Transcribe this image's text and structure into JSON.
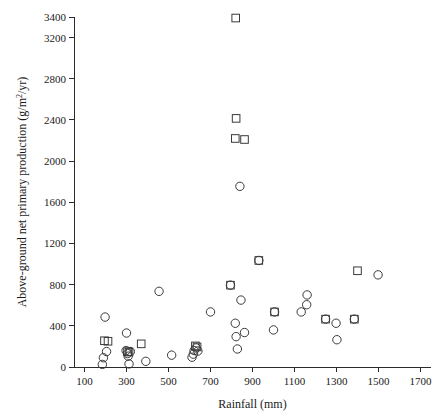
{
  "chart_data": {
    "type": "scatter",
    "title": "",
    "xlabel": "Rainfall (mm)",
    "ylabel": "Above-ground net primary production (g/m²/yr)",
    "ylabel_parts": {
      "before": "Above-ground net primary production (g/m",
      "sup": "2",
      "after": "/yr)"
    },
    "xlim": [
      50,
      1750
    ],
    "ylim": [
      0,
      3400
    ],
    "xticks": [
      100,
      300,
      500,
      700,
      900,
      1100,
      1300,
      1500,
      1700
    ],
    "xticklabels": [
      "100",
      "300",
      "500",
      "700",
      "900",
      "1100",
      "1300",
      "1500",
      "1700"
    ],
    "yticks": [
      0,
      400,
      800,
      1200,
      1600,
      2000,
      2400,
      2800,
      3200,
      3400
    ],
    "yticklabels": [
      "0",
      "400",
      "800",
      "1200",
      "1600",
      "2000",
      "2400",
      "2800",
      "3200",
      "3400"
    ],
    "grid": false,
    "legend": "none",
    "marker_color": "#3a3a3a",
    "series": [
      {
        "name": "circle-series",
        "marker": "circle",
        "points": [
          [
            185,
            25
          ],
          [
            190,
            90
          ],
          [
            198,
            485
          ],
          [
            205,
            150
          ],
          [
            300,
            330
          ],
          [
            298,
            160
          ],
          [
            305,
            130
          ],
          [
            308,
            105
          ],
          [
            312,
            30
          ],
          [
            318,
            150
          ],
          [
            392,
            55
          ],
          [
            455,
            735
          ],
          [
            515,
            115
          ],
          [
            612,
            95
          ],
          [
            618,
            125
          ],
          [
            622,
            160
          ],
          [
            632,
            185
          ],
          [
            640,
            155
          ],
          [
            700,
            535
          ],
          [
            818,
            425
          ],
          [
            822,
            295
          ],
          [
            828,
            175
          ],
          [
            840,
            1755
          ],
          [
            845,
            650
          ],
          [
            862,
            335
          ],
          [
            930,
            1035
          ],
          [
            795,
            795
          ],
          [
            1005,
            535
          ],
          [
            1000,
            360
          ],
          [
            1160,
            700
          ],
          [
            1158,
            605
          ],
          [
            1132,
            535
          ],
          [
            1298,
            425
          ],
          [
            1302,
            265
          ],
          [
            1248,
            465
          ],
          [
            1385,
            465
          ],
          [
            1498,
            895
          ]
        ]
      },
      {
        "name": "square-series",
        "marker": "square",
        "points": [
          [
            195,
            255
          ],
          [
            212,
            250
          ],
          [
            305,
            150
          ],
          [
            312,
            145
          ],
          [
            370,
            225
          ],
          [
            628,
            205
          ],
          [
            636,
            195
          ],
          [
            795,
            795
          ],
          [
            820,
            3390
          ],
          [
            822,
            2415
          ],
          [
            818,
            2220
          ],
          [
            862,
            2210
          ],
          [
            930,
            1035
          ],
          [
            1005,
            535
          ],
          [
            1248,
            465
          ],
          [
            1385,
            465
          ],
          [
            1400,
            935
          ]
        ]
      }
    ]
  },
  "plot": {
    "geometry": {
      "left": 74,
      "right": 431,
      "top": 17,
      "bottom": 367
    },
    "marker_size": {
      "circle_r": 4.2,
      "square_s": 7.6
    }
  }
}
